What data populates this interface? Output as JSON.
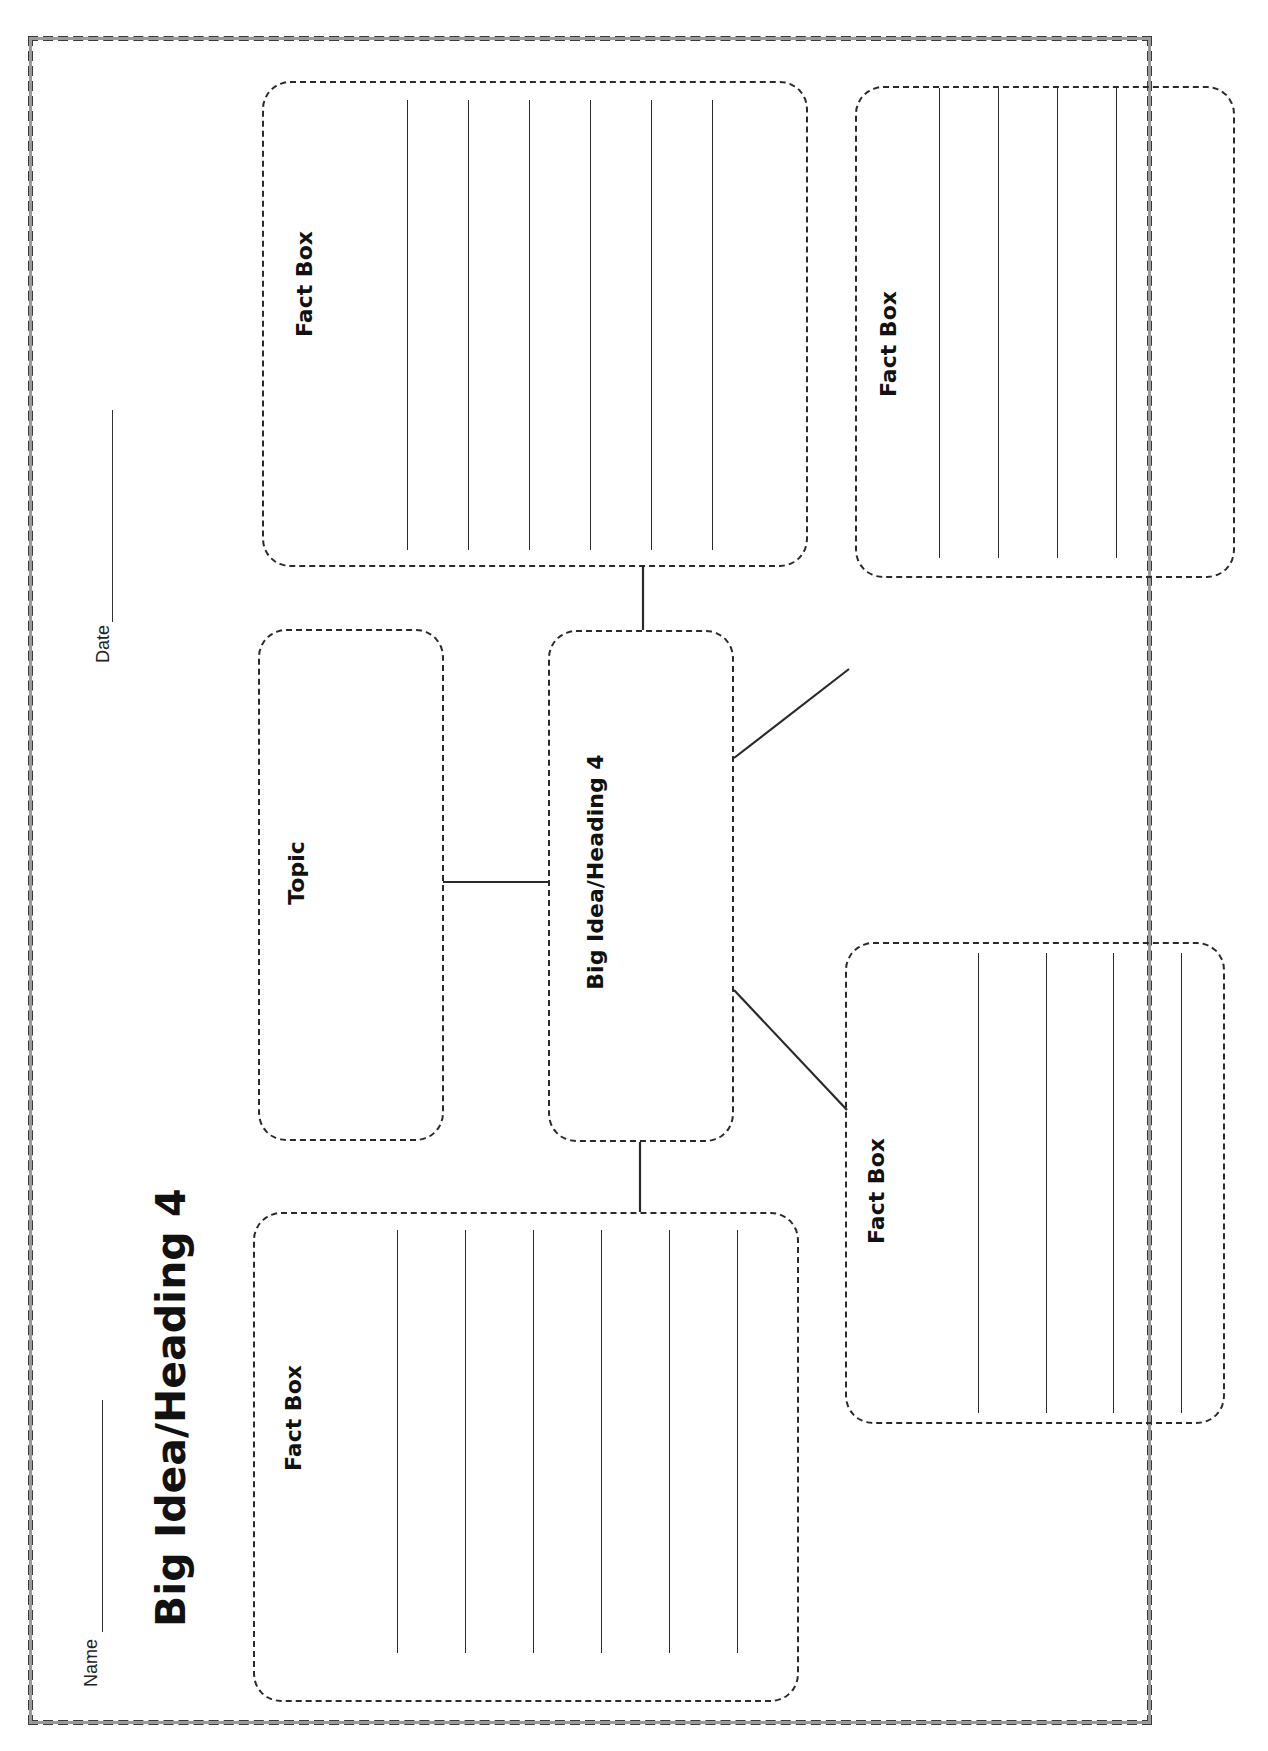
{
  "worksheet": {
    "title": "Big Idea/Heading 4",
    "name_label": "Name",
    "date_label": "Date",
    "topic_box": {
      "label": "Topic"
    },
    "central_box": {
      "label": "Big Idea/Heading 4"
    },
    "fact_boxes": [
      {
        "position": "top-left",
        "label": "Fact Box",
        "writing_lines": 6
      },
      {
        "position": "top-right",
        "label": "Fact Box",
        "writing_lines": 4
      },
      {
        "position": "bottom-left",
        "label": "Fact Box",
        "writing_lines": 6
      },
      {
        "position": "bottom-right",
        "label": "Fact Box",
        "writing_lines": 4
      }
    ],
    "orientation": "landscape page rotated 90° counter-clockwise",
    "colors": {
      "ink": "#2a2a2a",
      "paper": "#ffffff",
      "border": "#3a3a3a"
    }
  }
}
